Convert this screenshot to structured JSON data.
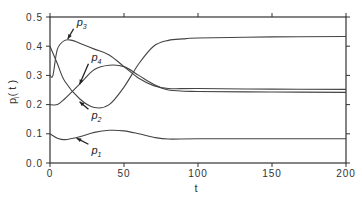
{
  "chart_data": {
    "type": "line",
    "title": "",
    "xlabel": "t",
    "ylabel": "p_i( t )",
    "xlim": [
      0,
      200
    ],
    "ylim": [
      0.0,
      0.5
    ],
    "grid": false,
    "legend": "inline arrow annotations",
    "x_ticks": [
      "0",
      "50",
      "100",
      "150",
      "200"
    ],
    "y_ticks": [
      "0.0",
      "0.1",
      "0.2",
      "0.3",
      "0.4",
      "0.5"
    ],
    "series": [
      {
        "name": "p1",
        "label": "p",
        "sub": "1",
        "x": [
          0,
          5,
          10,
          20,
          30,
          40,
          50,
          60,
          70,
          80,
          100,
          150,
          200
        ],
        "values": [
          0.1,
          0.085,
          0.08,
          0.09,
          0.105,
          0.112,
          0.11,
          0.1,
          0.088,
          0.082,
          0.083,
          0.083,
          0.083
        ]
      },
      {
        "name": "p2",
        "label": "p",
        "sub": "2",
        "x": [
          0,
          5,
          10,
          20,
          30,
          40,
          50,
          60,
          70,
          80,
          100,
          150,
          200
        ],
        "values": [
          0.2,
          0.2,
          0.22,
          0.27,
          0.32,
          0.335,
          0.33,
          0.3,
          0.27,
          0.25,
          0.245,
          0.243,
          0.242
        ]
      },
      {
        "name": "p3",
        "label": "p",
        "sub": "3",
        "x": [
          0,
          2,
          5,
          10,
          15,
          20,
          30,
          40,
          50,
          60,
          70,
          80,
          100,
          150,
          200
        ],
        "values": [
          0.3,
          0.3,
          0.39,
          0.42,
          0.42,
          0.41,
          0.39,
          0.37,
          0.33,
          0.29,
          0.265,
          0.255,
          0.255,
          0.253,
          0.252
        ]
      },
      {
        "name": "p4",
        "label": "p",
        "sub": "4",
        "x": [
          0,
          5,
          10,
          20,
          30,
          40,
          50,
          60,
          70,
          80,
          90,
          100,
          150,
          200
        ],
        "values": [
          0.4,
          0.34,
          0.28,
          0.22,
          0.19,
          0.2,
          0.26,
          0.34,
          0.4,
          0.42,
          0.425,
          0.428,
          0.432,
          0.433
        ]
      }
    ],
    "annotations": [
      {
        "series": "p3",
        "text_x": 18,
        "text_y": 0.47,
        "arrow_to_x": 12,
        "arrow_to_y": 0.425
      },
      {
        "series": "p4",
        "text_x": 28,
        "text_y": 0.35,
        "arrow_to_x": 20,
        "arrow_to_y": 0.27
      },
      {
        "series": "p2",
        "text_x": 28,
        "text_y": 0.15,
        "arrow_to_x": 20,
        "arrow_to_y": 0.21
      },
      {
        "series": "p1",
        "text_x": 28,
        "text_y": 0.03,
        "arrow_to_x": 18,
        "arrow_to_y": 0.085
      }
    ]
  },
  "axes": {
    "xlabel": "t",
    "ylabel_main": "p",
    "ylabel_sub": "i",
    "ylabel_tail": "( t )"
  }
}
